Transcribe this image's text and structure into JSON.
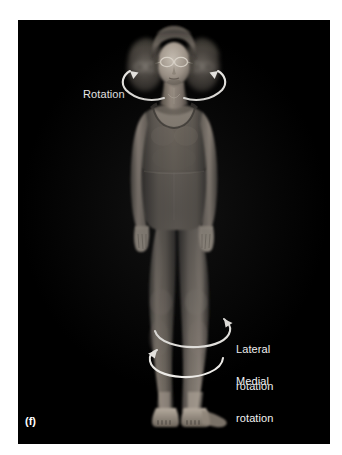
{
  "figure": {
    "panel_letter": "(f)",
    "background_color": "#ffffff",
    "plate_color": "#000000",
    "annotation_color": "#f2f2f2",
    "subject_description": "standing woman in dark sleeveless unitard, front view, multiple-exposure of head showing rotation"
  },
  "annotations": [
    {
      "id": "rotation",
      "text": "Rotation",
      "lines": [
        "Rotation"
      ],
      "anchor": "head-and-neck",
      "arrow_count": 2
    },
    {
      "id": "lateral_rotation",
      "text": "Lateral rotation",
      "lines": [
        "Lateral",
        "rotation"
      ],
      "anchor": "lower-leg",
      "arrow_count": 1
    },
    {
      "id": "medial_rotation",
      "text": "Medial rotation",
      "lines": [
        "Medial",
        "rotation"
      ],
      "anchor": "lower-leg",
      "arrow_count": 1
    }
  ],
  "labels": {
    "rotation_line1": "Rotation",
    "lateral_line1": "Lateral",
    "lateral_line2": "rotation",
    "medial_line1": "Medial",
    "medial_line2": "rotation",
    "panel_letter": "(f)"
  },
  "icons": {
    "head_arrow_left": "curved-rotation-arrow-left-icon",
    "head_arrow_right": "curved-rotation-arrow-right-icon",
    "leg_arrow_lateral": "curved-rotation-arrow-lateral-icon",
    "leg_arrow_medial": "curved-rotation-arrow-medial-icon"
  }
}
